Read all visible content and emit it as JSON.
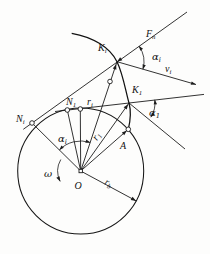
{
  "figure": {
    "description_colors": {
      "line": "#1c1c1c",
      "background": "#fdfdfc"
    },
    "labels": {
      "force_fn": {
        "main": "F",
        "sub": "n"
      },
      "point_ki": {
        "main": "K",
        "sub": "i"
      },
      "angle_alpha_i": {
        "main": "α",
        "sub": "i"
      },
      "velocity_vi": {
        "main": "v",
        "sub": "i"
      },
      "point_k1": {
        "main": "K",
        "sub": "1"
      },
      "point_n1": {
        "main": "N",
        "sub": "1"
      },
      "radius_ri": {
        "main": "r",
        "sub": "i"
      },
      "point_ni": {
        "main": "N",
        "sub": "i"
      },
      "angle_alpha_1": {
        "main": "α",
        "sub": "1"
      },
      "angle_alpha_i_center": {
        "main": "α",
        "sub": "i"
      },
      "radius_r1": {
        "main": "r",
        "sub": "1"
      },
      "point_a": {
        "main": "A",
        "sub": ""
      },
      "omega": {
        "main": "ω",
        "sub": ""
      },
      "center_o": {
        "main": "O",
        "sub": ""
      },
      "radius_rb": {
        "main": "r",
        "sub": "b"
      }
    }
  }
}
